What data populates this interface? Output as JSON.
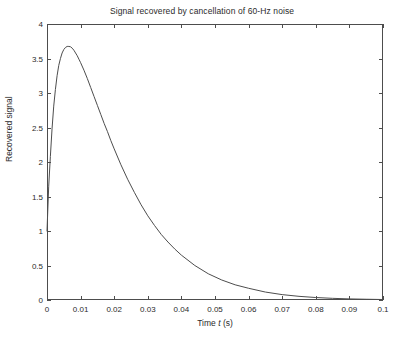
{
  "chart_data": {
    "type": "line",
    "title": "Signal recovered by cancellation of 60-Hz noise",
    "xlabel_prefix": "Time ",
    "xlabel_symbol": "t",
    "xlabel_suffix": " (s)",
    "xlabel": "Time t (s)",
    "ylabel": "Recovered signal",
    "xlim": [
      0,
      0.1
    ],
    "ylim": [
      0,
      4
    ],
    "grid": false,
    "legend": null,
    "box": true,
    "tick_direction": "in",
    "line_color": "#4d4d4d",
    "background_color": "#ffffff",
    "xticks": [
      0,
      0.01,
      0.02,
      0.03,
      0.04,
      0.05,
      0.06,
      0.07,
      0.08,
      0.09,
      0.1
    ],
    "xtick_labels": [
      "0",
      "0.01",
      "0.02",
      "0.03",
      "0.04",
      "0.05",
      "0.06",
      "0.07",
      "0.08",
      "0.09",
      "0.1"
    ],
    "yticks": [
      0,
      0.5,
      1,
      1.5,
      2,
      2.5,
      3,
      3.5,
      4
    ],
    "ytick_labels": [
      "0",
      "0.5",
      "1",
      "1.5",
      "2",
      "2.5",
      "3",
      "3.5",
      "4"
    ],
    "x": [
      0.0,
      0.0005,
      0.001,
      0.0015,
      0.002,
      0.0025,
      0.003,
      0.0035,
      0.004,
      0.0045,
      0.005,
      0.0055,
      0.006,
      0.0065,
      0.007,
      0.0075,
      0.008,
      0.0085,
      0.009,
      0.0095,
      0.01,
      0.011,
      0.012,
      0.013,
      0.014,
      0.015,
      0.016,
      0.017,
      0.018,
      0.019,
      0.02,
      0.022,
      0.024,
      0.026,
      0.028,
      0.03,
      0.032,
      0.034,
      0.036,
      0.038,
      0.04,
      0.044,
      0.048,
      0.052,
      0.056,
      0.06,
      0.065,
      0.07,
      0.075,
      0.08,
      0.085,
      0.09,
      0.095,
      0.1
    ],
    "y": [
      1.0,
      1.64,
      2.08,
      2.48,
      2.81,
      3.05,
      3.25,
      3.4,
      3.5,
      3.58,
      3.63,
      3.66,
      3.675,
      3.675,
      3.67,
      3.65,
      3.62,
      3.58,
      3.54,
      3.49,
      3.44,
      3.33,
      3.21,
      3.08,
      2.95,
      2.82,
      2.69,
      2.56,
      2.44,
      2.31,
      2.19,
      1.96,
      1.75,
      1.56,
      1.38,
      1.22,
      1.08,
      0.95,
      0.84,
      0.74,
      0.65,
      0.5,
      0.38,
      0.29,
      0.22,
      0.17,
      0.115,
      0.078,
      0.053,
      0.036,
      0.024,
      0.016,
      0.011,
      0.007
    ],
    "series_name": "recovered signal",
    "peak": {
      "x": 0.0092,
      "y": 3.675
    },
    "start_value": 1.0
  }
}
